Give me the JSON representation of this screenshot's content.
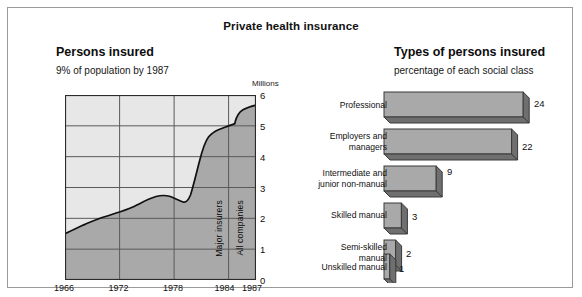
{
  "chart_title": "Private health insurance",
  "left": {
    "title": "Persons insured",
    "subtitle": "9% of population by 1987",
    "unit_label": "Millions",
    "annotation_major": "Major insurers",
    "annotation_all": "All companies",
    "yticks": [
      "6",
      "5",
      "4",
      "3",
      "2",
      "1",
      "0"
    ],
    "xticks": [
      "1966",
      "1972",
      "1978",
      "1984",
      "1987"
    ]
  },
  "right": {
    "title": "Types of persons insured",
    "subtitle": "percentage of each social class",
    "labels": [
      "Professional",
      "Employers and\nmanagers",
      "Intermediate and\njunior non-manual",
      "Skilled manual",
      "Semi-skilled\nmanual",
      "Unskilled manual"
    ],
    "values": [
      "24",
      "22",
      "9",
      "3",
      "2",
      "1"
    ]
  },
  "colors": {
    "area_fill": "#a9a9a9",
    "area_top": "#e7e7e7",
    "bar_face": "#a9a9a9",
    "bar_shadow": "#6f6f6f",
    "grid": "#5a5a5a",
    "border": "#9a9a9a"
  },
  "chart_data": [
    {
      "type": "area",
      "title": "Persons insured",
      "subtitle": "9% of population by 1987",
      "ylabel": "Millions",
      "xlabel": "",
      "ylim": [
        0,
        6
      ],
      "xlim": [
        1966,
        1987
      ],
      "grid": true,
      "legend": "none",
      "xticks": [
        1966,
        1972,
        1978,
        1984,
        1987
      ],
      "yticks": [
        0,
        1,
        2,
        3,
        4,
        5,
        6
      ],
      "annotations": [
        "Major insurers",
        "All companies"
      ],
      "series": [
        {
          "name": "Persons insured",
          "x": [
            1966,
            1968,
            1970,
            1972,
            1974,
            1975,
            1976,
            1977,
            1978,
            1979,
            1980,
            1981,
            1982,
            1983,
            1984,
            1985,
            1986,
            1987
          ],
          "values": [
            1.5,
            1.7,
            1.85,
            2.0,
            2.2,
            2.3,
            2.35,
            2.3,
            2.2,
            2.5,
            3.4,
            3.95,
            4.2,
            4.35,
            4.5,
            5.1,
            5.3,
            5.4
          ]
        }
      ]
    },
    {
      "type": "bar",
      "orientation": "horizontal",
      "title": "Types of persons insured",
      "subtitle": "percentage of each social class",
      "xlabel": "percentage",
      "ylabel": "",
      "grid": false,
      "legend": "none",
      "categories": [
        "Professional",
        "Employers and managers",
        "Intermediate and junior non-manual",
        "Skilled manual",
        "Semi-skilled manual",
        "Unskilled manual"
      ],
      "values": [
        24,
        22,
        9,
        3,
        2,
        1
      ],
      "xlim": [
        0,
        24
      ]
    }
  ]
}
